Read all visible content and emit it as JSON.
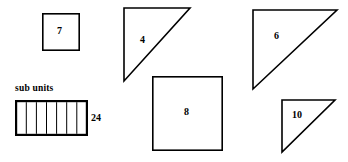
{
  "figure": {
    "caption": "sub units",
    "shapes": [
      {
        "id": "square-7",
        "kind": "square",
        "label": "7",
        "x": 42,
        "y": 13,
        "w": 37,
        "h": 37,
        "stroke": "#000000",
        "fill": "#ffffff",
        "stroke_width": 1.6,
        "label_x": 60,
        "label_y": 31
      },
      {
        "id": "triangle-4",
        "kind": "right-triangle",
        "label": "4",
        "x": 123,
        "y": 7,
        "w": 67,
        "h": 74,
        "stroke": "#000000",
        "fill": "#ffffff",
        "stroke_width": 1.6,
        "label_x": 143,
        "label_y": 41,
        "orientation": "right-angle-top-left"
      },
      {
        "id": "triangle-6",
        "kind": "right-triangle",
        "label": "6",
        "x": 252,
        "y": 9,
        "w": 85,
        "h": 80,
        "stroke": "#000000",
        "fill": "#ffffff",
        "stroke_width": 1.6,
        "label_x": 277,
        "label_y": 37,
        "orientation": "right-angle-top-left"
      },
      {
        "id": "rectangle-24",
        "kind": "segmented-rectangle",
        "label": "24",
        "x": 15,
        "y": 100,
        "w": 72,
        "h": 35,
        "stroke": "#000000",
        "fill": "#ffffff",
        "stroke_width": 2.2,
        "segments": 7,
        "label_x": 93,
        "label_y": 117
      },
      {
        "id": "square-8",
        "kind": "square",
        "label": "8",
        "x": 152,
        "y": 76,
        "w": 70,
        "h": 74,
        "stroke": "#000000",
        "fill": "#ffffff",
        "stroke_width": 1.6,
        "label_x": 187,
        "label_y": 113
      },
      {
        "id": "triangle-10",
        "kind": "right-triangle",
        "label": "10",
        "x": 281,
        "y": 99,
        "w": 54,
        "h": 53,
        "stroke": "#000000",
        "fill": "#ffffff",
        "stroke_width": 1.6,
        "label_x": 298,
        "label_y": 116,
        "orientation": "right-angle-top-left"
      }
    ],
    "caption_pos": {
      "x": 15,
      "y": 86
    },
    "background": "#ffffff",
    "line_color": "#000000"
  },
  "labels": {
    "square_7": "7",
    "triangle_4": "4",
    "triangle_6": "6",
    "rect_24": "24",
    "square_8": "8",
    "triangle_10": "10",
    "sub_units": "sub units"
  }
}
